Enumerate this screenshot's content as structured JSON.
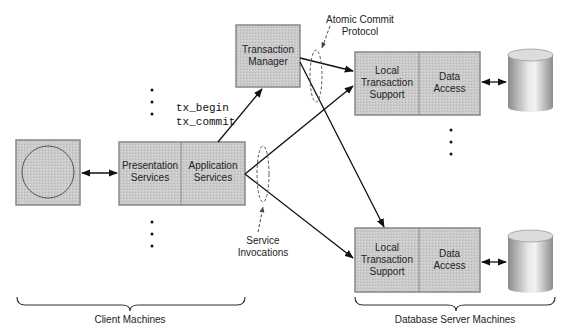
{
  "diagram": {
    "client": {
      "terminal": "client-terminal",
      "presentation_label": [
        "Presentation",
        "Services"
      ],
      "application_label": [
        "Application",
        "Services"
      ],
      "group_label": "Client Machines"
    },
    "transaction_manager": {
      "label": [
        "Transaction",
        "Manager"
      ]
    },
    "calls": {
      "line1": "tx_begin",
      "line2": "tx_commit"
    },
    "annotations": {
      "atomic_commit": [
        "Atomic Commit",
        "Protocol"
      ],
      "service_invocations": [
        "Service",
        "Invocations"
      ]
    },
    "servers": [
      {
        "local_label": [
          "Local",
          "Transaction",
          "Support"
        ],
        "data_label": [
          "Data",
          "Access"
        ]
      },
      {
        "local_label": [
          "Local",
          "Transaction",
          "Support"
        ],
        "data_label": [
          "Data",
          "Access"
        ]
      }
    ],
    "server_group_label": "Database Server Machines",
    "colors": {
      "box_fill": "#c8c8c8",
      "box_border": "#777777",
      "line": "#111111",
      "bg": "#ffffff"
    }
  }
}
